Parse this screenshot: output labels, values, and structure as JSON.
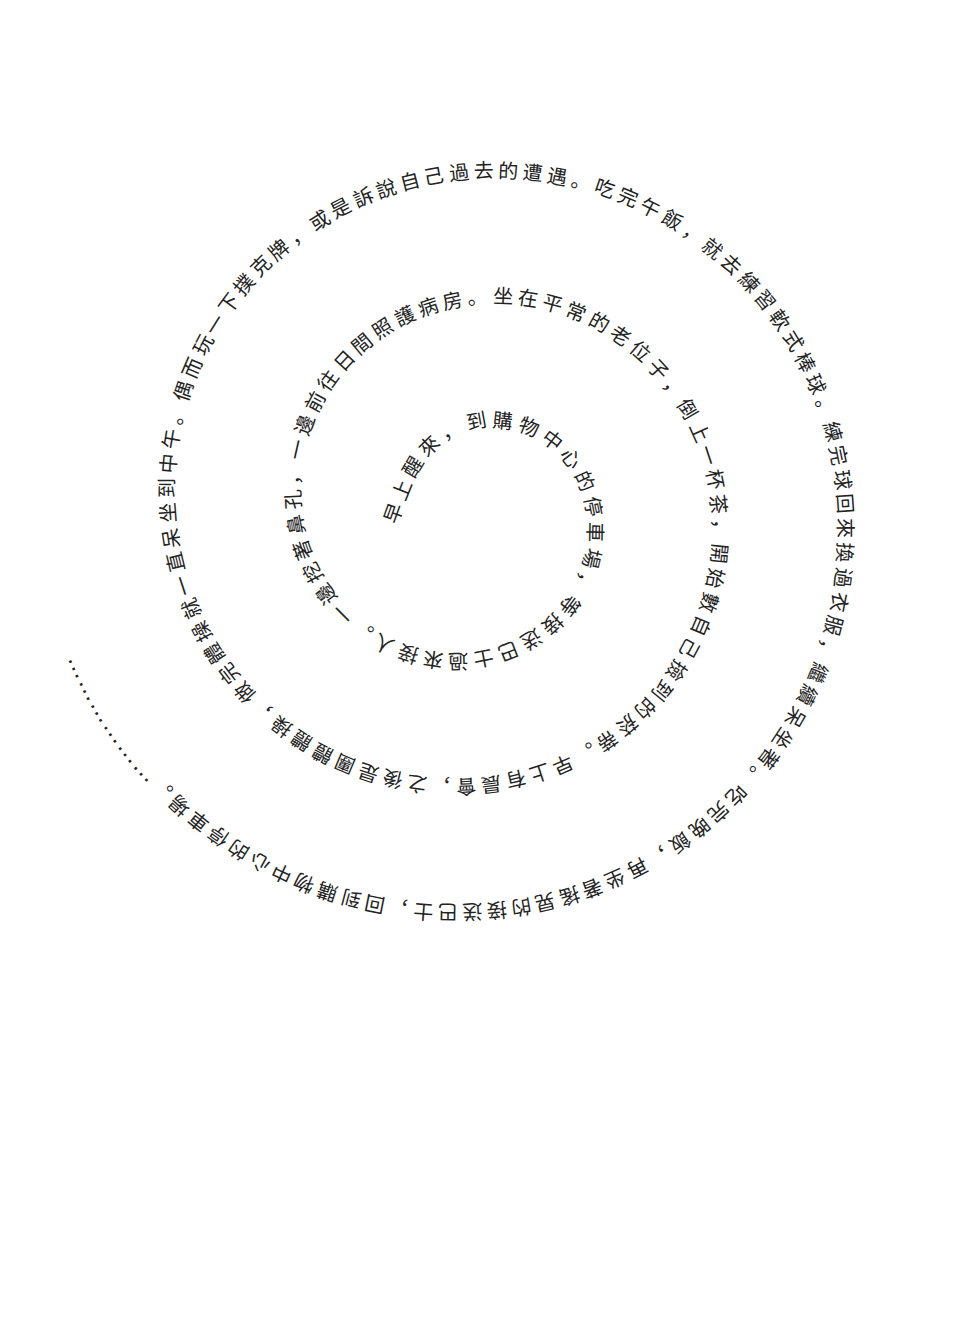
{
  "page": {
    "background": "#ffffff",
    "ink_color": "#232323"
  },
  "spiral": {
    "text": "早上醒來，到購物中心的停車場，等接送巴士過來接人。一邊挖著鼻孔，一邊前往日間照護病房。坐在平常的老位子，倒上一杯茶，開始數自己撿到的菸蒂。早上有晨會，之後是團體體操，做完體操就一直呆坐到中午。偶而玩一下撲克牌，或是訴說自己過去的遭遇。吃完午飯，就去練習軟式棒球。練完球回來換過衣服，繼續呆坐著。吃完晚飯，再坐著搖晃的接送巴士，回到購物中心的停車場。",
    "ellipsis": "………………"
  }
}
